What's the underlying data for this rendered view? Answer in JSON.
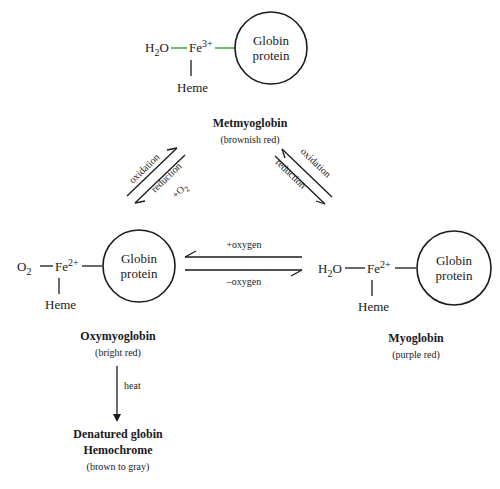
{
  "diagram": {
    "metmyoglobin": {
      "ligand": "H",
      "ligand_sub": "2",
      "ligand_tail": "O",
      "iron": "Fe",
      "iron_charge": "3+",
      "heme": "Heme",
      "globin_line1": "Globin",
      "globin_line2": "protein",
      "name": "Metmyoglobin",
      "color": "(brownish red)",
      "bond_color": "#3aa83a"
    },
    "oxymyoglobin": {
      "ligand": "O",
      "ligand_sub": "2",
      "iron": "Fe",
      "iron_charge": "2+",
      "heme": "Heme",
      "globin_line1": "Globin",
      "globin_line2": "protein",
      "name": "Oxymyoglobin",
      "color": "(bright red)"
    },
    "myoglobin": {
      "ligand": "H",
      "ligand_sub": "2",
      "ligand_tail": "O",
      "iron": "Fe",
      "iron_charge": "2+",
      "heme": "Heme",
      "globin_line1": "Globin",
      "globin_line2": "protein",
      "name": "Myoglobin",
      "color": "(purple red)"
    },
    "left_arrows": {
      "up_label": "oxidation",
      "down_label": "reduction",
      "extra": "+O",
      "extra_sub": "2"
    },
    "right_arrows": {
      "up_label": "oxidation",
      "down_label": "reduction"
    },
    "horizontal_arrows": {
      "top_label": "+oxygen",
      "bottom_label": "–oxygen"
    },
    "heat_arrow": {
      "label": "heat"
    },
    "denatured": {
      "line1": "Denatured globin",
      "line2": "Hemochrome",
      "color": "(brown to gray)"
    }
  }
}
